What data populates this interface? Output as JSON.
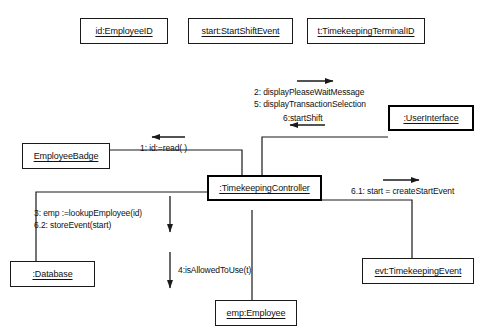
{
  "diagram": {
    "type": "uml-communication-diagram",
    "colors": {
      "line": "#1a1a1a",
      "thick_border": "#000000",
      "background": "#ffffff",
      "text": "#111111"
    },
    "objects": [
      {
        "id": "employee-id",
        "label": "id:EmployeeID",
        "emphasis": "normal"
      },
      {
        "id": "start-shift-event",
        "label": "start:StartShiftEvent",
        "emphasis": "normal"
      },
      {
        "id": "timekeeping-terminal-id",
        "label": "t:TimekeepingTerminalID",
        "emphasis": "normal"
      },
      {
        "id": "user-interface",
        "label": ":UserInterface",
        "emphasis": "thick"
      },
      {
        "id": "employee-badge",
        "label": "EmployeeBadge",
        "emphasis": "normal"
      },
      {
        "id": "timekeeping-controller",
        "label": ":TimekeepingController",
        "emphasis": "thick"
      },
      {
        "id": "database",
        "label": ":Database",
        "emphasis": "normal"
      },
      {
        "id": "employee",
        "label": "emp:Employee",
        "emphasis": "normal"
      },
      {
        "id": "timekeeping-event",
        "label": "evt:TimekeepingEvent",
        "emphasis": "normal"
      }
    ],
    "messages": [
      {
        "id": "msg-1",
        "text": "1: id:=read( )",
        "direction": "left",
        "from": "timekeeping-controller",
        "to": "employee-badge"
      },
      {
        "id": "msg-2",
        "text": "2: displayPleaseWaitMessage",
        "direction": "right",
        "from": "timekeeping-controller",
        "to": "user-interface"
      },
      {
        "id": "msg-5",
        "text": "5: displayTransactionSelection",
        "direction": "right",
        "from": "timekeeping-controller",
        "to": "user-interface"
      },
      {
        "id": "msg-6",
        "text": "6:startShift",
        "direction": "left",
        "from": "user-interface",
        "to": "timekeeping-controller"
      },
      {
        "id": "msg-3",
        "text": "3: emp :=lookupEmployee(id)",
        "direction": "down",
        "from": "timekeeping-controller",
        "to": "database"
      },
      {
        "id": "msg-6-2",
        "text": "6.2: storeEvent(start)",
        "direction": "down",
        "from": "timekeeping-controller",
        "to": "database"
      },
      {
        "id": "msg-4",
        "text": "4:isAllowedToUse(t)",
        "direction": "down",
        "from": "timekeeping-controller",
        "to": "employee"
      },
      {
        "id": "msg-6-1",
        "text": "6.1: start = createStartEvent",
        "direction": "right",
        "from": "timekeeping-controller",
        "to": "timekeeping-event"
      }
    ]
  }
}
